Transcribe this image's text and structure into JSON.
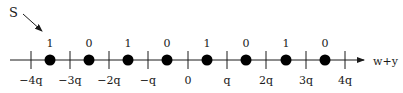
{
  "diagram": {
    "pointer_label": "S",
    "axis_label": "w+y",
    "tick_labels": [
      "−4q",
      "−3q",
      "−2q",
      "−q",
      "0",
      "q",
      "2q",
      "3q",
      "4q"
    ],
    "tick_x": [
      31,
      70,
      109,
      148,
      188,
      227,
      266,
      306,
      345
    ],
    "dots": [
      {
        "x": 50,
        "value": "1"
      },
      {
        "x": 89,
        "value": "0"
      },
      {
        "x": 128,
        "value": "1"
      },
      {
        "x": 167,
        "value": "0"
      },
      {
        "x": 207,
        "value": "1"
      },
      {
        "x": 246,
        "value": "0"
      },
      {
        "x": 286,
        "value": "1"
      },
      {
        "x": 325,
        "value": "0"
      }
    ],
    "colors": {
      "line": "#1a1a1a",
      "dot": "#000000",
      "background": "#ffffff"
    }
  }
}
